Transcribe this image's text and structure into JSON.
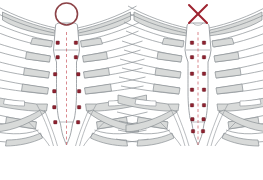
{
  "figure": {
    "background_color": "#ffffff",
    "width": 263,
    "height": 180
  },
  "palette": {
    "bone_outline": "#8a8f94",
    "bone_fill": "#ffffff",
    "cartilage_fill": "#d8dad9",
    "cartilage_outline": "#8a8f94",
    "marker_red": "#9e2430",
    "marker_dark": "#7d1f29",
    "midline_dash": "#cf6b72",
    "symbol_circle": "#8c4247",
    "symbol_cross": "#9e2430"
  },
  "panels": [
    {
      "id": "panel-correct",
      "verdict_symbol": "circle",
      "verdict_label": "O",
      "verdict_meaning": "correct",
      "symbol_color": "#8c4247",
      "marker_count": 12,
      "marker_placement": "paired lateral to midline at costal cartilage junctions",
      "markers": [
        {
          "x": 58,
          "y": 43
        },
        {
          "x": 76,
          "y": 43
        },
        {
          "x": 58,
          "y": 57
        },
        {
          "x": 76,
          "y": 57
        },
        {
          "x": 55,
          "y": 74
        },
        {
          "x": 78,
          "y": 74
        },
        {
          "x": 54,
          "y": 91
        },
        {
          "x": 79,
          "y": 91
        },
        {
          "x": 54,
          "y": 107
        },
        {
          "x": 79,
          "y": 107
        },
        {
          "x": 55,
          "y": 122
        },
        {
          "x": 78,
          "y": 122
        }
      ],
      "midline": {
        "x": 66.5,
        "y_top": 32,
        "y_bottom": 146,
        "style": "dashed"
      }
    },
    {
      "id": "panel-incorrect",
      "verdict_symbol": "cross",
      "verdict_label": "X",
      "verdict_meaning": "incorrect",
      "symbol_color": "#9e2430",
      "marker_count": 14,
      "marker_placement": "on the sternal body along the midline",
      "markers": [
        {
          "x": 191,
          "y": 43
        },
        {
          "x": 205,
          "y": 43
        },
        {
          "x": 191,
          "y": 57
        },
        {
          "x": 205,
          "y": 57
        },
        {
          "x": 191,
          "y": 74
        },
        {
          "x": 205,
          "y": 74
        },
        {
          "x": 191,
          "y": 90
        },
        {
          "x": 205,
          "y": 90
        },
        {
          "x": 191,
          "y": 105
        },
        {
          "x": 205,
          "y": 105
        },
        {
          "x": 191,
          "y": 119
        },
        {
          "x": 205,
          "y": 119
        },
        {
          "x": 192,
          "y": 131
        },
        {
          "x": 204,
          "y": 131
        }
      ],
      "midline": {
        "x": 198,
        "y_top": 32,
        "y_bottom": 146,
        "style": "dashed"
      }
    }
  ],
  "anatomy": {
    "structures": [
      "clavicle",
      "manubrium",
      "sternal-body",
      "xiphoid-process",
      "costal-cartilage",
      "ribs"
    ],
    "rib_pairs_visible": 7
  }
}
